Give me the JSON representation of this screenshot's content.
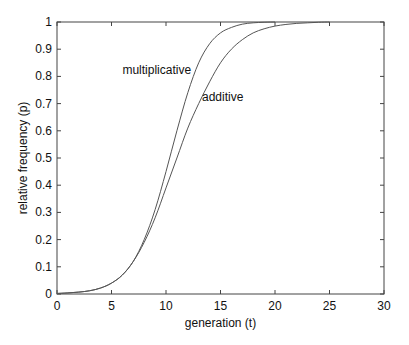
{
  "chart_data": {
    "type": "line",
    "title": "",
    "xlabel": "generation (t)",
    "ylabel": "relative frequency (p)",
    "xlim": [
      0,
      30
    ],
    "ylim": [
      0,
      1
    ],
    "xticks": [
      0,
      5,
      10,
      15,
      20,
      25,
      30
    ],
    "xtick_labels": [
      "0",
      "5",
      "10",
      "15",
      "20",
      "25",
      "30"
    ],
    "yticks": [
      0,
      0.1,
      0.2,
      0.3,
      0.4,
      0.5,
      0.6,
      0.7,
      0.8,
      0.9,
      1
    ],
    "ytick_labels": [
      "0",
      "0.1",
      "0.2",
      "0.3",
      "0.4",
      "0.5",
      "0.6",
      "0.7",
      "0.8",
      "0.9",
      "1"
    ],
    "grid": false,
    "legend": "none",
    "series": [
      {
        "name": "multiplicative",
        "color": "#555555",
        "x": [
          0,
          1,
          2,
          3,
          4,
          5,
          6,
          7,
          8,
          9,
          10,
          11,
          12,
          13,
          14,
          15,
          16,
          17,
          18,
          19,
          20
        ],
        "y": [
          0.002,
          0.004,
          0.007,
          0.012,
          0.022,
          0.04,
          0.07,
          0.12,
          0.2,
          0.31,
          0.45,
          0.6,
          0.74,
          0.85,
          0.92,
          0.96,
          0.98,
          0.992,
          0.997,
          0.999,
          1.0
        ]
      },
      {
        "name": "additive",
        "color": "#555555",
        "x": [
          0,
          1,
          2,
          3,
          4,
          5,
          6,
          7,
          8,
          9,
          10,
          11,
          12,
          13,
          14,
          15,
          16,
          17,
          18,
          19,
          20,
          21,
          22,
          23,
          24,
          25
        ],
        "y": [
          0.002,
          0.004,
          0.007,
          0.012,
          0.022,
          0.04,
          0.07,
          0.12,
          0.19,
          0.28,
          0.39,
          0.5,
          0.61,
          0.7,
          0.78,
          0.85,
          0.9,
          0.935,
          0.96,
          0.975,
          0.985,
          0.991,
          0.995,
          0.997,
          0.999,
          1.0
        ]
      }
    ],
    "annotations": [
      {
        "text": "multiplicative",
        "x": 6.0,
        "y": 0.81
      },
      {
        "text": "additive",
        "x": 13.3,
        "y": 0.71
      }
    ]
  }
}
